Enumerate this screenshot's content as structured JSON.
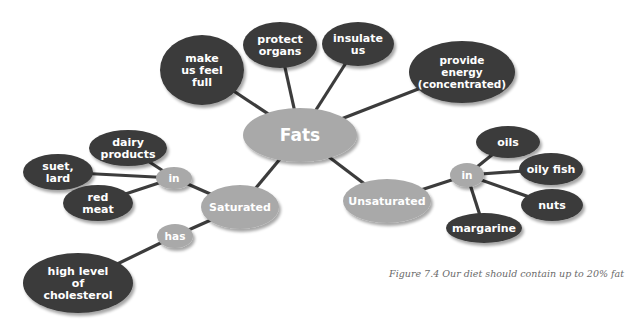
{
  "colors": {
    "dark_node": "#3a3a3a",
    "light_node": "#a9a9a9",
    "line": "#3c3c3c",
    "text": "#ffffff",
    "caption": "#6a6a6a"
  },
  "diagram": {
    "center": {
      "id": "fats",
      "label": "Fats",
      "cx": 300,
      "cy": 135,
      "rx": 57,
      "ry": 27,
      "style": "light",
      "font": 17
    },
    "nodes": [
      {
        "id": "make-us-feel-full",
        "lines": [
          "make",
          "us feel",
          "full"
        ],
        "cx": 202,
        "cy": 70,
        "rx": 42,
        "ry": 35,
        "style": "dark",
        "font": 11
      },
      {
        "id": "protect-organs",
        "lines": [
          "protect",
          "organs"
        ],
        "cx": 280,
        "cy": 45,
        "rx": 37,
        "ry": 23,
        "style": "dark",
        "font": 11
      },
      {
        "id": "insulate-us",
        "lines": [
          "insulate",
          "us"
        ],
        "cx": 358,
        "cy": 44,
        "rx": 36,
        "ry": 22,
        "style": "dark",
        "font": 11
      },
      {
        "id": "provide-energy",
        "lines": [
          "provide",
          "energy",
          "(concentrated)"
        ],
        "cx": 462,
        "cy": 72,
        "rx": 53,
        "ry": 31,
        "style": "dark",
        "font": 10.5
      },
      {
        "id": "saturated",
        "lines": [
          "Saturated"
        ],
        "cx": 240,
        "cy": 207,
        "rx": 39,
        "ry": 22,
        "style": "light",
        "font": 11
      },
      {
        "id": "sat-in",
        "lines": [
          "in"
        ],
        "cx": 174,
        "cy": 178,
        "rx": 18,
        "ry": 11,
        "style": "light",
        "font": 10.5
      },
      {
        "id": "sat-has",
        "lines": [
          "has"
        ],
        "cx": 175,
        "cy": 236,
        "rx": 18,
        "ry": 12,
        "style": "light",
        "font": 10.5
      },
      {
        "id": "dairy-products",
        "lines": [
          "dairy",
          "products"
        ],
        "cx": 128,
        "cy": 148,
        "rx": 39,
        "ry": 18,
        "style": "dark",
        "font": 11
      },
      {
        "id": "suet-lard",
        "lines": [
          "suet,",
          "lard"
        ],
        "cx": 58,
        "cy": 172,
        "rx": 35,
        "ry": 18,
        "style": "dark",
        "font": 11
      },
      {
        "id": "red-meat",
        "lines": [
          "red",
          "meat"
        ],
        "cx": 98,
        "cy": 203,
        "rx": 35,
        "ry": 18,
        "style": "dark",
        "font": 11
      },
      {
        "id": "high-level-of-cholesterol",
        "lines": [
          "high level",
          "of",
          "cholesterol"
        ],
        "cx": 78,
        "cy": 283,
        "rx": 55,
        "ry": 30,
        "style": "dark",
        "font": 11
      },
      {
        "id": "unsaturated",
        "lines": [
          "Unsaturated"
        ],
        "cx": 387,
        "cy": 201,
        "rx": 44,
        "ry": 22,
        "style": "light",
        "font": 11
      },
      {
        "id": "unsat-in",
        "lines": [
          "in"
        ],
        "cx": 467,
        "cy": 175,
        "rx": 17,
        "ry": 12,
        "style": "light",
        "font": 10.5
      },
      {
        "id": "oils",
        "lines": [
          "oils"
        ],
        "cx": 508,
        "cy": 142,
        "rx": 32,
        "ry": 16,
        "style": "dark",
        "font": 11
      },
      {
        "id": "oily-fish",
        "lines": [
          "oily fish"
        ],
        "cx": 551,
        "cy": 169,
        "rx": 32,
        "ry": 16,
        "style": "dark",
        "font": 11
      },
      {
        "id": "nuts",
        "lines": [
          "nuts"
        ],
        "cx": 552,
        "cy": 205,
        "rx": 31,
        "ry": 16,
        "style": "dark",
        "font": 11
      },
      {
        "id": "margarine",
        "lines": [
          "margarine"
        ],
        "cx": 484,
        "cy": 228,
        "rx": 38,
        "ry": 15,
        "style": "dark",
        "font": 11
      }
    ],
    "edges": [
      [
        "fats",
        "make-us-feel-full"
      ],
      [
        "fats",
        "protect-organs"
      ],
      [
        "fats",
        "insulate-us"
      ],
      [
        "fats",
        "provide-energy"
      ],
      [
        "fats",
        "saturated"
      ],
      [
        "fats",
        "unsaturated"
      ],
      [
        "saturated",
        "sat-in"
      ],
      [
        "saturated",
        "sat-has"
      ],
      [
        "sat-in",
        "dairy-products"
      ],
      [
        "sat-in",
        "suet-lard"
      ],
      [
        "sat-in",
        "red-meat"
      ],
      [
        "sat-has",
        "high-level-of-cholesterol"
      ],
      [
        "unsaturated",
        "unsat-in"
      ],
      [
        "unsat-in",
        "oils"
      ],
      [
        "unsat-in",
        "oily-fish"
      ],
      [
        "unsat-in",
        "nuts"
      ],
      [
        "unsat-in",
        "margarine"
      ]
    ]
  },
  "caption": "Figure 7.4  Our diet should contain up to 20% fat"
}
